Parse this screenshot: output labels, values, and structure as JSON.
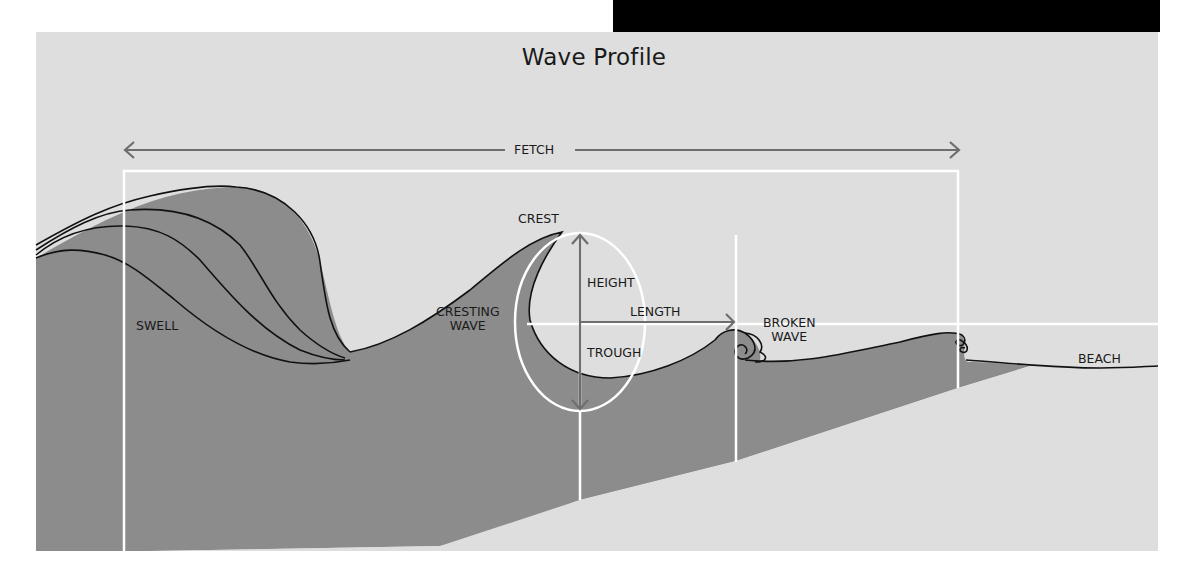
{
  "title": "Wave Profile",
  "labels": {
    "fetch": "FETCH",
    "swell": "SWELL",
    "cresting_wave_line1": "CRESTING",
    "cresting_wave_line2": "WAVE",
    "crest": "CREST",
    "height": "HEIGHT",
    "length": "LENGTH",
    "trough": "TROUGH",
    "broken_wave_line1": "BROKEN",
    "broken_wave_line2": "WAVE",
    "beach": "BEACH"
  },
  "colors": {
    "background": "#dedede",
    "water": "#8c8c8c",
    "outline": "#111111",
    "guides": "#ffffff",
    "arrows": "#6e6e6e",
    "top_bar": "#000000"
  }
}
